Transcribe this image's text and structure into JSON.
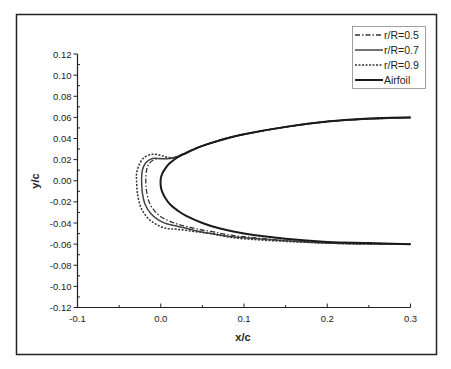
{
  "chart_data": {
    "type": "line",
    "title": "",
    "xlabel": "x/c",
    "ylabel": "y/c",
    "xlim": [
      -0.1,
      0.3
    ],
    "ylim": [
      -0.12,
      0.12
    ],
    "x_ticks": [
      -0.1,
      0.0,
      0.1,
      0.2,
      0.3
    ],
    "x_tick_labels": [
      "-0.1",
      "0.0",
      "0.1",
      "0.2",
      "0.3"
    ],
    "y_ticks": [
      0.12,
      0.1,
      0.08,
      0.06,
      0.04,
      0.02,
      0.0,
      -0.02,
      -0.04,
      -0.06,
      -0.08,
      -0.1,
      -0.12
    ],
    "y_tick_labels": [
      "0.12",
      "0.10",
      "0.08",
      "0.06",
      "0.04",
      "0.02",
      "0.00",
      "-0.02",
      "-0.04",
      "-0.06",
      "-0.08",
      "-0.10",
      "-0.12"
    ],
    "grid": false,
    "legend_position": "upper right",
    "series": [
      {
        "name": "r/R=0.5",
        "style": "dash-dot",
        "color": "#333333",
        "x": [
          0.3,
          0.2,
          0.1,
          0.05,
          0.02,
          0.01,
          0.0,
          -0.008,
          -0.014,
          -0.017,
          -0.018,
          -0.017,
          -0.014,
          -0.008,
          0.0,
          0.01,
          0.02,
          0.04,
          0.06,
          0.1,
          0.2,
          0.3
        ],
        "y": [
          0.06,
          0.056,
          0.044,
          0.033,
          0.023,
          0.021,
          0.021,
          0.02,
          0.016,
          0.01,
          0.0,
          -0.01,
          -0.02,
          -0.028,
          -0.034,
          -0.038,
          -0.041,
          -0.045,
          -0.048,
          -0.053,
          -0.059,
          -0.06
        ]
      },
      {
        "name": "r/R=0.7",
        "style": "solid",
        "color": "#444444",
        "x": [
          0.3,
          0.2,
          0.1,
          0.05,
          0.02,
          0.01,
          0.0,
          -0.01,
          -0.018,
          -0.022,
          -0.023,
          -0.022,
          -0.019,
          -0.012,
          -0.003,
          0.008,
          0.02,
          0.04,
          0.06,
          0.1,
          0.2,
          0.3
        ],
        "y": [
          0.06,
          0.056,
          0.044,
          0.033,
          0.023,
          0.021,
          0.021,
          0.021,
          0.017,
          0.01,
          0.0,
          -0.012,
          -0.022,
          -0.031,
          -0.037,
          -0.041,
          -0.043,
          -0.047,
          -0.05,
          -0.054,
          -0.059,
          -0.06
        ]
      },
      {
        "name": "r/R=0.9",
        "style": "dashed",
        "color": "#333333",
        "x": [
          0.3,
          0.2,
          0.1,
          0.05,
          0.02,
          0.01,
          0.0,
          -0.01,
          -0.02,
          -0.026,
          -0.029,
          -0.029,
          -0.028,
          -0.024,
          -0.016,
          -0.006,
          0.006,
          0.02,
          0.04,
          0.06,
          0.1,
          0.2,
          0.3
        ],
        "y": [
          0.06,
          0.056,
          0.044,
          0.033,
          0.023,
          0.022,
          0.024,
          0.025,
          0.022,
          0.015,
          0.007,
          0.0,
          -0.012,
          -0.025,
          -0.035,
          -0.041,
          -0.045,
          -0.046,
          -0.048,
          -0.05,
          -0.055,
          -0.059,
          -0.06
        ]
      },
      {
        "name": "Airfoil",
        "style": "solid-thick",
        "color": "#1a1a1a",
        "x": [
          0.3,
          0.25,
          0.2,
          0.15,
          0.1,
          0.07,
          0.05,
          0.03,
          0.02,
          0.01,
          0.005,
          0.002,
          0.0,
          0.0,
          0.002,
          0.006,
          0.012,
          0.02,
          0.03,
          0.05,
          0.07,
          0.1,
          0.15,
          0.2,
          0.25,
          0.3
        ],
        "y": [
          0.06,
          0.059,
          0.056,
          0.051,
          0.044,
          0.038,
          0.033,
          0.026,
          0.022,
          0.016,
          0.011,
          0.007,
          0.002,
          -0.005,
          -0.011,
          -0.017,
          -0.023,
          -0.028,
          -0.033,
          -0.04,
          -0.045,
          -0.05,
          -0.055,
          -0.058,
          -0.059,
          -0.06
        ]
      }
    ]
  },
  "legend": {
    "items": [
      {
        "label": "r/R=0.5",
        "style": "dash-dot"
      },
      {
        "label": "r/R=0.7",
        "style": "solid"
      },
      {
        "label": "r/R=0.9",
        "style": "dashed"
      },
      {
        "label": "Airfoil",
        "style": "solid-thick"
      }
    ]
  },
  "axes": {
    "xlabel": "x/c",
    "ylabel": "y/c"
  }
}
